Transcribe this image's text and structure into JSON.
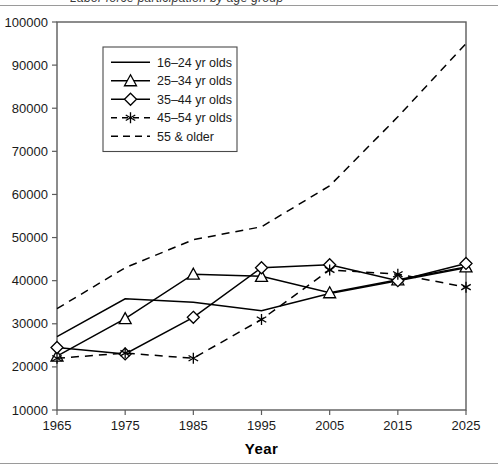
{
  "figure": {
    "clipped_title": "Labor force participation by age group",
    "background": "#ffffff",
    "line_color": "#000000",
    "axis_color": "#5c5c5c"
  },
  "chart_data": {
    "type": "line",
    "title": "",
    "xlabel": "Year",
    "ylabel": "",
    "x": [
      1965,
      1975,
      1985,
      1995,
      2005,
      2015,
      2025
    ],
    "xticklabels": [
      "1965",
      "1975",
      "1985",
      "1995",
      "2005",
      "2015",
      "2025"
    ],
    "xlim": [
      1965,
      2025
    ],
    "ylim": [
      10000,
      100000
    ],
    "yticks": [
      10000,
      20000,
      30000,
      40000,
      50000,
      60000,
      70000,
      80000,
      90000,
      100000
    ],
    "yticklabels": [
      "10000",
      "20000",
      "30000",
      "40000",
      "50000",
      "60000",
      "70000",
      "80000",
      "90000",
      "100000"
    ],
    "grid": false,
    "legend_position": "upper left",
    "series": [
      {
        "name": "16-24 yr olds",
        "label": "16–24 yr olds",
        "marker": "none",
        "dash": "solid",
        "values": [
          27000,
          35800,
          35000,
          33000,
          37000,
          40000,
          43000
        ]
      },
      {
        "name": "25-34 yr olds",
        "label": "25–34 yr olds",
        "marker": "triangle",
        "dash": "solid",
        "values": [
          22500,
          31200,
          41500,
          41000,
          37200,
          40200,
          43200
        ]
      },
      {
        "name": "35-44 yr olds",
        "label": "35–44 yr olds",
        "marker": "diamond",
        "dash": "solid",
        "values": [
          24500,
          23000,
          31500,
          43000,
          43700,
          40000,
          44000
        ]
      },
      {
        "name": "45-54 yr olds",
        "label": "45–54 yr olds",
        "marker": "star",
        "dash": "dashed",
        "values": [
          22000,
          23200,
          22000,
          31000,
          42500,
          41500,
          38500
        ]
      },
      {
        "name": "55 & older",
        "label": "55 & older",
        "marker": "none",
        "dash": "dashed",
        "values": [
          33500,
          43000,
          49500,
          52500,
          62000,
          78000,
          95000
        ]
      }
    ]
  }
}
